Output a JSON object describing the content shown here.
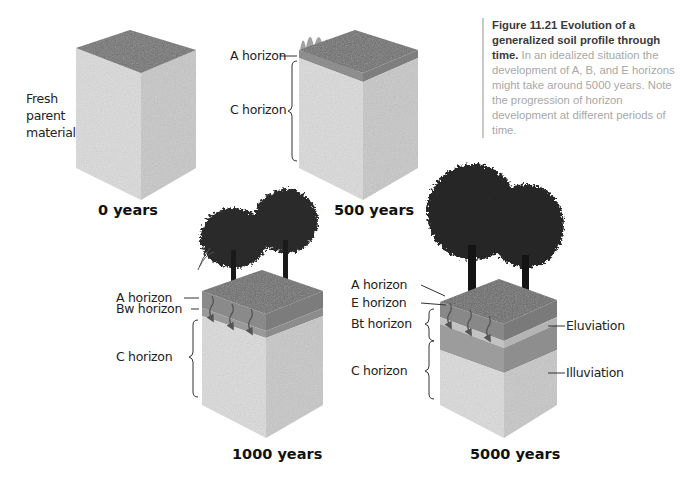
{
  "caption": {
    "figure_number": "Figure 11.21",
    "title": "Evolution of a generalized soil profile through time.",
    "body": "In an idealized situation the development of A, B, and E horizons might take around 5000 years. Note the progression of horizon development at different periods of time."
  },
  "colors": {
    "parent_material_front": "#d9d9d9",
    "parent_material_side": "#c4c4c4",
    "top_grass": "#6e6e6e",
    "a_horizon": "#8a8a8a",
    "e_horizon": "#bdbdbd",
    "b_horizon": "#9c9c9c",
    "tree": "#1e1e1e",
    "caption_title": "#3a3a3a",
    "caption_body": "#a8a8a8"
  },
  "panels": [
    {
      "id": "0-years",
      "label": "0 years",
      "left_label": [
        "Fresh",
        "parent",
        "material"
      ]
    },
    {
      "id": "500-years",
      "label": "500 years",
      "horizons": [
        "A horizon",
        "C horizon"
      ]
    },
    {
      "id": "1000-years",
      "label": "1000 years",
      "horizons": [
        "A horizon",
        "Bw horizon",
        "C horizon"
      ]
    },
    {
      "id": "5000-years",
      "label": "5000 years",
      "horizons": [
        "A horizon",
        "E horizon",
        "Bt horizon",
        "C horizon"
      ],
      "processes": [
        "Eluviation",
        "Illuviation"
      ]
    }
  ]
}
